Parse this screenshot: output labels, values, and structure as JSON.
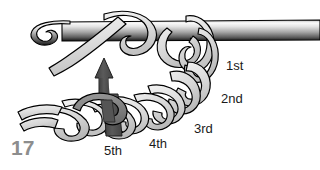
{
  "figure": {
    "number": "17",
    "number_color": "#8d8d8d",
    "background_color": "#ffffff",
    "labels": [
      {
        "id": "1st",
        "text": "1st"
      },
      {
        "id": "2nd",
        "text": "2nd"
      },
      {
        "id": "3rd",
        "text": "3rd"
      },
      {
        "id": "4th",
        "text": "4th"
      },
      {
        "id": "5th",
        "text": "5th"
      }
    ],
    "colors": {
      "yarn_fill": "#d9d9d9",
      "yarn_fill_light": "#e8e8e8",
      "yarn_outline": "#000000",
      "hook_light": "#f2f2f2",
      "hook_mid": "#8f8f8f",
      "hook_dark": "#2b2b2b",
      "arrow_dark": "#4d4d4d",
      "arrow_mid": "#7a7a7a",
      "label_text": "#1a1a1a"
    }
  }
}
